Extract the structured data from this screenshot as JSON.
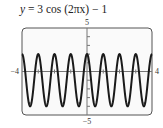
{
  "chart_data": {
    "type": "line",
    "title": "y = 3 cos (2πx) − 1",
    "function": "3*cos(2*pi*x) - 1",
    "xlabel": "",
    "ylabel": "",
    "xlim": [
      -4,
      4
    ],
    "ylim": [
      -5,
      5
    ],
    "tick_labels": {
      "xmin": "−4",
      "xmax": "4",
      "ymax": "5",
      "ymin": "−5"
    },
    "x_ticks_step": 1,
    "y_ticks_step": 1,
    "grid": false,
    "series": [
      {
        "name": "y = 3 cos (2πx) − 1",
        "amplitude": 3,
        "period": 1,
        "vertical_shift": -1,
        "max": 2,
        "min": -4,
        "color": "#1a1a1a"
      }
    ]
  },
  "labels": {
    "title_prefix": "y",
    "title_rest": " = 3 cos (2πx) − 1"
  },
  "colors": {
    "frame": "#555555",
    "axis": "#777777",
    "curve": "#1a1a1a",
    "background": "#fafafa"
  }
}
